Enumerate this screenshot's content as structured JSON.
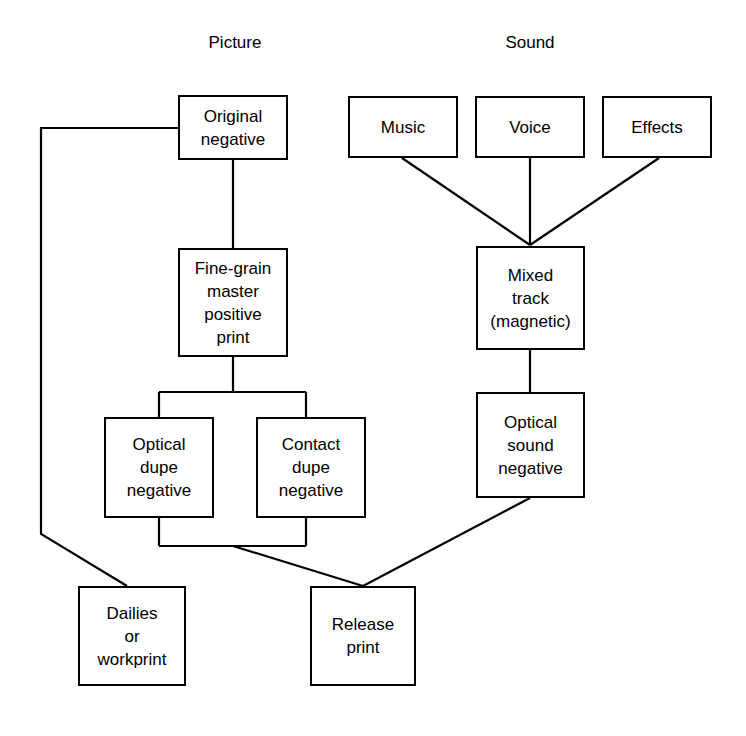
{
  "diagram": {
    "background_color": "#ffffff",
    "line_color": "#000000",
    "text_color": "#000000",
    "headings": [
      {
        "id": "picture",
        "label": "Picture"
      },
      {
        "id": "sound",
        "label": "Sound"
      }
    ],
    "nodes": [
      {
        "id": "original-negative",
        "label": "Original\nnegative",
        "column": "picture"
      },
      {
        "id": "fine-grain-master",
        "label": "Fine-grain\nmaster\npositive\nprint",
        "column": "picture"
      },
      {
        "id": "optical-dupe-negative",
        "label": "Optical\ndupe\nnegative",
        "column": "picture"
      },
      {
        "id": "contact-dupe-negative",
        "label": "Contact\ndupe\nnegative",
        "column": "picture"
      },
      {
        "id": "dailies-or-workprint",
        "label": "Dailies\nor\nworkprint",
        "column": "picture"
      },
      {
        "id": "release-print",
        "label": "Release\nprint",
        "column": "picture"
      },
      {
        "id": "music",
        "label": "Music",
        "column": "sound"
      },
      {
        "id": "voice",
        "label": "Voice",
        "column": "sound"
      },
      {
        "id": "effects",
        "label": "Effects",
        "column": "sound"
      },
      {
        "id": "mixed-track",
        "label": "Mixed\ntrack\n(magnetic)",
        "column": "sound"
      },
      {
        "id": "optical-sound-negative",
        "label": "Optical\nsound\nnegative",
        "column": "sound"
      }
    ],
    "edges": [
      {
        "id": "original-negative-to-dailies",
        "from": "original-negative",
        "to": "dailies-or-workprint"
      },
      {
        "id": "original-negative-to-fine-grain-master",
        "from": "original-negative",
        "to": "fine-grain-master"
      },
      {
        "id": "fine-grain-master-to-optical-dupe",
        "from": "fine-grain-master",
        "to": "optical-dupe-negative"
      },
      {
        "id": "fine-grain-master-to-contact-dupe",
        "from": "fine-grain-master",
        "to": "contact-dupe-negative"
      },
      {
        "id": "dupes-to-release-print",
        "from": "optical-dupe-negative",
        "to": "release-print"
      },
      {
        "id": "music-to-mixed-track",
        "from": "music",
        "to": "mixed-track"
      },
      {
        "id": "voice-to-mixed-track",
        "from": "voice",
        "to": "mixed-track"
      },
      {
        "id": "effects-to-mixed-track",
        "from": "effects",
        "to": "mixed-track"
      },
      {
        "id": "mixed-track-to-optical-sound-negative",
        "from": "mixed-track",
        "to": "optical-sound-negative"
      },
      {
        "id": "optical-sound-negative-to-release-print",
        "from": "optical-sound-negative",
        "to": "release-print"
      }
    ]
  }
}
